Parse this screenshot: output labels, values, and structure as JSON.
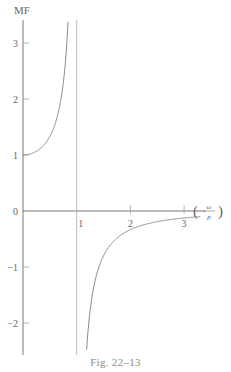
{
  "chart_data": {
    "type": "line",
    "title": "",
    "caption": "Fig. 22–13",
    "ylabel": "MF",
    "xlabel": "(ω/p)",
    "xlabel_num": "ω",
    "xlabel_den": "p",
    "xlim": [
      0,
      3.4
    ],
    "ylim": [
      -2.6,
      3.4
    ],
    "grid": false,
    "legend": null,
    "x_ticks": [
      1,
      2,
      3
    ],
    "x_tick_labels": [
      "1",
      "2",
      "3"
    ],
    "y_ticks": [
      3,
      2,
      1,
      0,
      -1,
      -2
    ],
    "y_tick_labels": [
      "3",
      "2",
      "1",
      "0",
      "−1",
      "−2"
    ],
    "vertical_asymptote": 1,
    "function": "MF = 1 / (1 - (ω/p)^2)",
    "series": [
      {
        "name": "MF (ω/p < 1)",
        "x": [
          0,
          0.1,
          0.2,
          0.3,
          0.4,
          0.5,
          0.6,
          0.7,
          0.75,
          0.8,
          0.85,
          0.9
        ],
        "values": [
          1.0,
          1.01,
          1.04,
          1.1,
          1.19,
          1.33,
          1.56,
          1.96,
          2.29,
          2.78,
          3.6,
          5.26
        ]
      },
      {
        "name": "MF (ω/p > 1)",
        "x": [
          1.1,
          1.15,
          1.2,
          1.3,
          1.4,
          1.5,
          1.75,
          2.0,
          2.25,
          2.5,
          2.75,
          3.0,
          3.2
        ],
        "values": [
          -4.76,
          -3.1,
          -2.27,
          -1.45,
          -1.04,
          -0.8,
          -0.48,
          -0.33,
          -0.25,
          -0.19,
          -0.15,
          -0.125,
          -0.11
        ]
      }
    ]
  }
}
